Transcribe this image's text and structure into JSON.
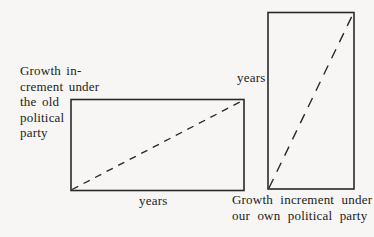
{
  "diagram": {
    "type": "comparison-rectangles",
    "colors": {
      "background": "#f7f6f4",
      "stroke": "#2a2a2a",
      "text": "#1c1c1c"
    },
    "left_figure": {
      "rect": {
        "x": 71,
        "y": 99,
        "width": 173,
        "height": 91
      },
      "diagonal": {
        "style": "dashed",
        "from": "bottom-left",
        "to": "top-right"
      },
      "side_label_lines": [
        "Growth in-",
        "crement under",
        "the old",
        "political",
        "party"
      ],
      "bottom_label": "years"
    },
    "right_figure": {
      "rect": {
        "x": 268,
        "y": 12,
        "width": 86,
        "height": 177
      },
      "diagonal": {
        "style": "dashed",
        "from": "bottom-left",
        "to": "top-right"
      },
      "side_label": "years",
      "bottom_label_lines": [
        "Growth increment under",
        "our own political party"
      ]
    }
  }
}
